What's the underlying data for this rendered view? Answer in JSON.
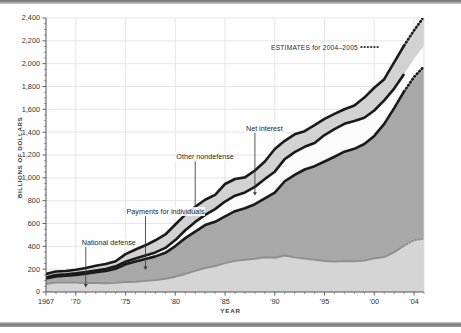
{
  "figure": {
    "y_axis_title": "BILLIONS OF DOLLARS",
    "x_axis_title": "YEAR"
  },
  "legend": {
    "estimates_label": "ESTIMATES for 2004–2005",
    "estimates_dots": "••••••"
  },
  "annotations": {
    "national_defense": "National defense",
    "payments_for_individuals": "Payments for individuals",
    "other_nondefense": "Other nondefense",
    "net_interest": "Net interest"
  },
  "axis": {
    "y_ticks": [
      "0",
      "200",
      "400",
      "600",
      "800",
      "1,000",
      "1,200",
      "1,400",
      "1,600",
      "1,800",
      "2,000",
      "2,200",
      "2,400"
    ],
    "x_ticks": [
      "1967",
      "'70",
      "'75",
      "'80",
      "'85",
      "'90",
      "'95",
      "'00",
      "'04"
    ]
  },
  "colors": {
    "national_defense_fill": "#d5d5d5",
    "payments_fill": "#a8a8a8",
    "net_interest_fill": "#fbfbfb",
    "other_nondefense_fill": "#d2d2d2",
    "boundary_line": "#1a1a1a",
    "defense_line": "#8f8f8f",
    "grid": "#dcdcdc",
    "axis": "#555555"
  },
  "chart_data": {
    "type": "area",
    "title": "",
    "subtitle": "",
    "xlabel": "YEAR",
    "ylabel": "BILLIONS OF DOLLARS",
    "stacked": true,
    "grid": true,
    "legend_position": "inside-top-right",
    "xlim": [
      1967,
      2005
    ],
    "ylim": [
      0,
      2400
    ],
    "x_tick_values": [
      1967,
      1970,
      1975,
      1980,
      1985,
      1990,
      1995,
      2000,
      2004
    ],
    "y_tick_values": [
      0,
      200,
      400,
      600,
      800,
      1000,
      1200,
      1400,
      1600,
      1800,
      2000,
      2200,
      2400
    ],
    "estimate_years": [
      2004,
      2005
    ],
    "x": [
      1967,
      1968,
      1969,
      1970,
      1971,
      1972,
      1973,
      1974,
      1975,
      1976,
      1977,
      1978,
      1979,
      1980,
      1981,
      1982,
      1983,
      1984,
      1985,
      1986,
      1987,
      1988,
      1989,
      1990,
      1991,
      1992,
      1993,
      1994,
      1995,
      1996,
      1997,
      1998,
      1999,
      2000,
      2001,
      2002,
      2003,
      2004,
      2005
    ],
    "series": [
      {
        "name": "National defense",
        "order": 1,
        "values": [
          71,
          82,
          82,
          82,
          79,
          79,
          77,
          80,
          87,
          90,
          97,
          104,
          116,
          134,
          158,
          185,
          210,
          227,
          253,
          273,
          282,
          290,
          304,
          300,
          320,
          303,
          292,
          282,
          272,
          266,
          271,
          269,
          275,
          295,
          306,
          349,
          405,
          454,
          466
        ]
      },
      {
        "name": "Payments for individuals",
        "order": 2,
        "values": [
          47,
          55,
          60,
          68,
          81,
          94,
          107,
          124,
          155,
          177,
          193,
          208,
          227,
          268,
          314,
          344,
          376,
          388,
          410,
          435,
          451,
          479,
          516,
          570,
          650,
          723,
          781,
          820,
          871,
          919,
          958,
          985,
          1021,
          1072,
          1167,
          1262,
          1352,
          1430,
          1510
        ]
      },
      {
        "name": "Net interest",
        "order": 3,
        "values": [
          10,
          11,
          13,
          14,
          15,
          15,
          17,
          21,
          23,
          27,
          30,
          35,
          43,
          53,
          69,
          85,
          90,
          111,
          129,
          136,
          139,
          152,
          169,
          184,
          194,
          199,
          199,
          203,
          232,
          241,
          244,
          243,
          230,
          223,
          206,
          171,
          153,
          159,
          178
        ]
      },
      {
        "name": "Other nondefense",
        "order": 4,
        "values": [
          30,
          31,
          29,
          31,
          36,
          42,
          45,
          44,
          67,
          78,
          89,
          106,
          118,
          136,
          137,
          133,
          132,
          125,
          154,
          146,
          132,
          143,
          154,
          199,
          160,
          156,
          137,
          156,
          141,
          134,
          128,
          136,
          177,
          199,
          185,
          229,
          249,
          249,
          258
        ]
      }
    ],
    "totals": [
      158,
      179,
      184,
      195,
      211,
      230,
      246,
      269,
      332,
      372,
      409,
      453,
      504,
      591,
      678,
      747,
      808,
      851,
      946,
      990,
      1004,
      1064,
      1143,
      1253,
      1324,
      1381,
      1409,
      1461,
      1516,
      1560,
      1601,
      1633,
      1703,
      1789,
      1864,
      2011,
      2159,
      2292,
      2412
    ],
    "annotations": [
      {
        "text": "National defense",
        "points_to_series": "National defense",
        "x": 1971,
        "label_x": 1970.5,
        "label_y": 430
      },
      {
        "text": "Payments for individuals",
        "points_to_series": "Payments for individuals",
        "x": 1977,
        "label_x": 1975,
        "label_y": 700
      },
      {
        "text": "Other nondefense",
        "points_to_series": "Other nondefense",
        "x": 1982,
        "label_x": 1980,
        "label_y": 1180
      },
      {
        "text": "Net interest",
        "points_to_series": "Net interest",
        "x": 1988,
        "label_x": 1987,
        "label_y": 1430
      }
    ]
  }
}
